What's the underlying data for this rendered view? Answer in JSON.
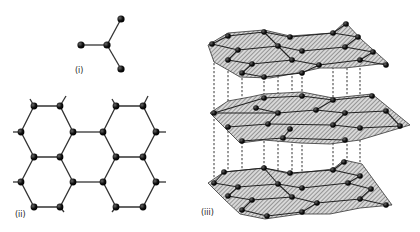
{
  "figure": {
    "panels": [
      {
        "id": "i",
        "label": "(i)",
        "description": "trigonal planar carbon atom with three bonds"
      },
      {
        "id": "ii",
        "label": "(ii)",
        "description": "hexagonal layer of carbon atoms"
      },
      {
        "id": "iii",
        "label": "(iii)",
        "description": "stacked layers of graphite connected by dashed lines"
      }
    ]
  },
  "colors": {
    "atom": "#111111",
    "bond": "#333333",
    "sheet_hatch": "#555555",
    "background": "#ffffff"
  }
}
